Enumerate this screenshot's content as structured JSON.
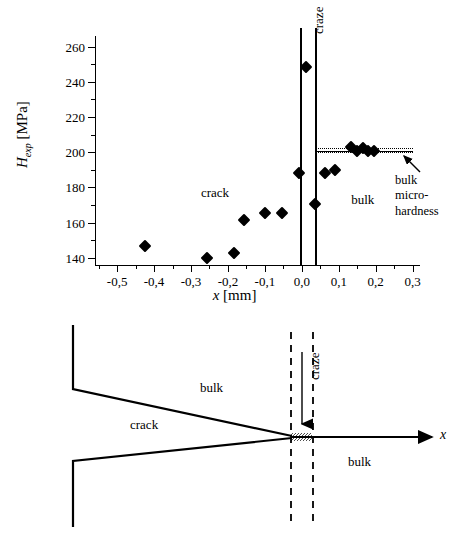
{
  "figure": {
    "top_panel_name": "microhardness-profile-plot",
    "bottom_panel_name": "crack-craze-schematic"
  },
  "chart_data": {
    "type": "scatter",
    "title": "",
    "xlabel": "x [mm]",
    "ylabel": "H_exp [MPa]",
    "xlabel_var": "x",
    "xlabel_unit": "[mm]",
    "ylabel_var": "H",
    "ylabel_sub": "exp",
    "ylabel_unit": "[MPa]",
    "xlim": [
      -0.56,
      0.32
    ],
    "ylim": [
      136,
      266
    ],
    "x_ticks": [
      -0.5,
      -0.4,
      -0.3,
      -0.2,
      -0.1,
      0.0,
      0.1,
      0.2,
      0.3
    ],
    "x_tick_labels": [
      "-0,5",
      "-0,4",
      "-0,3",
      "-0,2",
      "-0,1",
      "0,0",
      "0,1",
      "0,2",
      "0,3"
    ],
    "x_minor_step": 0.05,
    "y_ticks": [
      140,
      160,
      180,
      200,
      220,
      240,
      260
    ],
    "y_tick_labels": [
      "140",
      "160",
      "180",
      "200",
      "220",
      "240",
      "260"
    ],
    "y_minor_step": 10,
    "grid": false,
    "legend": "none",
    "marker_style": "filled-diamond",
    "marker_color": "#000000",
    "points": [
      {
        "x": -0.425,
        "y": 147
      },
      {
        "x": -0.256,
        "y": 140
      },
      {
        "x": -0.183,
        "y": 143
      },
      {
        "x": -0.157,
        "y": 161.5
      },
      {
        "x": -0.1,
        "y": 165.5
      },
      {
        "x": -0.055,
        "y": 165.5
      },
      {
        "x": -0.008,
        "y": 188
      },
      {
        "x": 0.012,
        "y": 248.5
      },
      {
        "x": 0.037,
        "y": 170.5
      },
      {
        "x": 0.063,
        "y": 188
      },
      {
        "x": 0.09,
        "y": 190
      },
      {
        "x": 0.133,
        "y": 203
      },
      {
        "x": 0.15,
        "y": 201
      },
      {
        "x": 0.167,
        "y": 202.5
      },
      {
        "x": 0.18,
        "y": 201
      },
      {
        "x": 0.195,
        "y": 201
      }
    ],
    "craze_boundaries": {
      "label": "craze",
      "x_left": -0.004,
      "x_right": 0.037
    },
    "reference_band": {
      "label": "bulk micro-hardness",
      "label_lines": [
        "bulk",
        "micro-",
        "hardness"
      ],
      "x_start": 0.037,
      "x_end": 0.3,
      "center": 201.0,
      "upper": 202.2,
      "lower": 200.0,
      "center_style": "solid",
      "bound_style": "dotted"
    },
    "region_labels": [
      {
        "text": "crack",
        "x": -0.235,
        "y": 177
      },
      {
        "text": "bulk",
        "x": 0.165,
        "y": 173
      }
    ]
  },
  "bottom_diagram": {
    "labels": {
      "bulk_upper": "bulk",
      "crack": "crack",
      "bulk_lower": "bulk",
      "craze": "craze",
      "axis": "x"
    },
    "description": "Schematic of a crack with craze zone at the tip along the x axis",
    "line_color": "#000000",
    "craze_line_style": "dashed"
  }
}
